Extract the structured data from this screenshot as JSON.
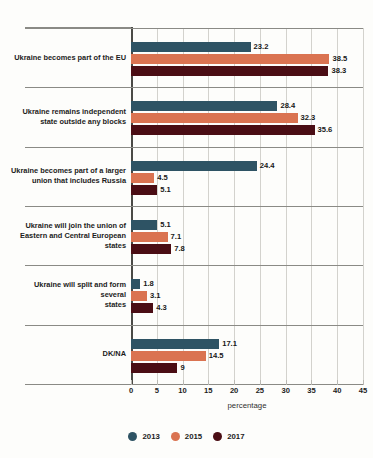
{
  "chart_data": {
    "type": "bar",
    "orientation": "horizontal",
    "title": "",
    "subtitle": "",
    "xlabel": "percentage",
    "ylabel": "",
    "xlim": [
      0,
      45
    ],
    "xticks": [
      0,
      5,
      10,
      15,
      20,
      25,
      30,
      35,
      40,
      45
    ],
    "grid": true,
    "legend_position": "bottom",
    "categories": [
      "Ukraine becomes part of the EU",
      "Ukraine remains independent state outside any blocks",
      "Ukraine becomes part of a larger union that includes Russia",
      "Ukraine will join the union of Eastern and Central European states",
      "Ukraine will split and form several states",
      "DK/NA"
    ],
    "series": [
      {
        "name": "2013",
        "color": "#2e5364",
        "values": [
          23.2,
          28.4,
          24.4,
          5.1,
          1.8,
          17.1
        ],
        "labels": [
          "23.2",
          "28.4",
          "24.4",
          "5.1",
          "1.8",
          "17.1"
        ]
      },
      {
        "name": "2015",
        "color": "#da7351",
        "values": [
          38.5,
          32.3,
          4.5,
          7.1,
          3.1,
          14.5
        ],
        "labels": [
          "38.5",
          "32.3",
          "4.5",
          "7.1",
          "3.1",
          "14.5"
        ]
      },
      {
        "name": "2017",
        "color": "#4a0d14",
        "values": [
          38.3,
          35.6,
          5.1,
          7.8,
          4.3,
          9
        ],
        "labels": [
          "38.3",
          "35.6",
          "5.1",
          "7.8",
          "4.3",
          "9"
        ]
      }
    ]
  },
  "category_lines": [
    [
      "Ukraine becomes part of the EU"
    ],
    [
      "Ukraine remains independent",
      "state outside any blocks"
    ],
    [
      "Ukraine becomes part of a larger",
      "union that includes Russia"
    ],
    [
      "Ukraine will join the union of",
      "Eastern and Central European",
      "states"
    ],
    [
      "Ukraine will split and form several",
      "states"
    ],
    [
      "DK/NA"
    ]
  ],
  "axis": {
    "title": "percentage",
    "tick_labels": [
      "0",
      "5",
      "10",
      "15",
      "20",
      "25",
      "30",
      "35",
      "40",
      "45"
    ]
  },
  "legend": {
    "items": [
      {
        "label": "2013",
        "color": "#2e5364"
      },
      {
        "label": "2015",
        "color": "#da7351"
      },
      {
        "label": "2017",
        "color": "#4a0d14"
      }
    ]
  },
  "colors": {
    "series_2013": "#2e5364",
    "series_2015": "#da7351",
    "series_2017": "#4a0d14",
    "gridline": "#d3d2cd",
    "axis": "#4a4a46",
    "separator": "#8a8a85",
    "background": "#fdfdfb"
  }
}
